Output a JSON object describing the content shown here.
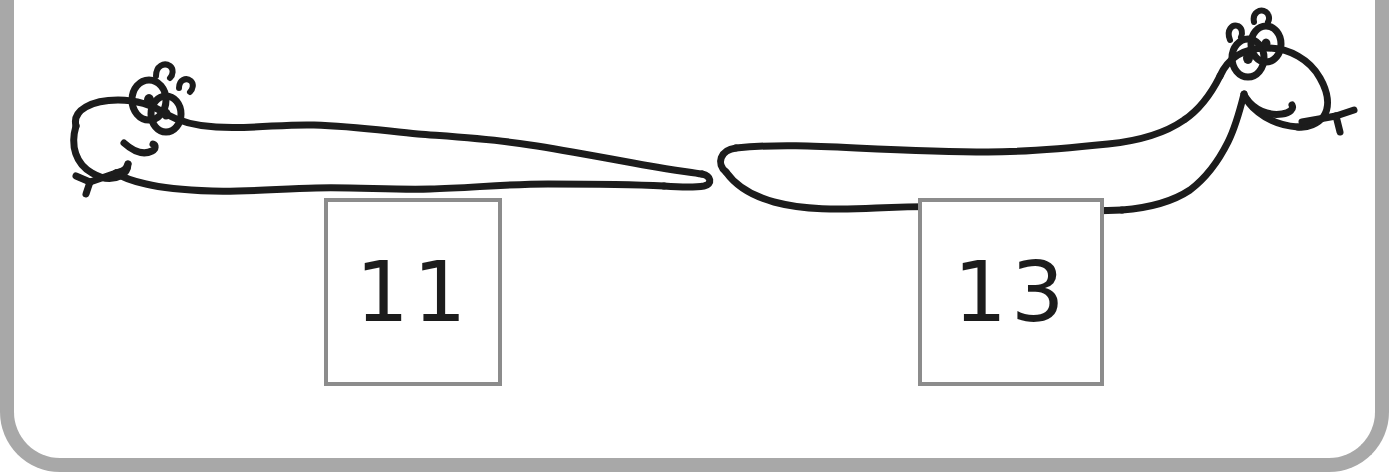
{
  "page": {
    "kind": "math-worksheet-card",
    "background_color": "#ffffff",
    "frame_color": "#a8a8a8",
    "ink_color": "#1c1c1c",
    "box_border_color": "#8c8c8c"
  },
  "illustrations": [
    {
      "name": "worm-left",
      "subject": "cartoon worm",
      "facing": "left",
      "features": [
        "two-eyes",
        "two-antennae",
        "smile",
        "forked-tongue",
        "wavy-body",
        "pointed-tail"
      ],
      "pose": "flat horizontal body, head at left"
    },
    {
      "name": "worm-right",
      "subject": "cartoon worm",
      "facing": "right",
      "features": [
        "two-eyes",
        "two-antennae",
        "smile",
        "forked-tongue",
        "wavy-body",
        "rounded-tail"
      ],
      "pose": "body rises to a raised head at right"
    }
  ],
  "answers": [
    {
      "name": "answer-box-left",
      "value": "11",
      "for_illustration": "worm-left"
    },
    {
      "name": "answer-box-right",
      "value": "13",
      "for_illustration": "worm-right"
    }
  ]
}
